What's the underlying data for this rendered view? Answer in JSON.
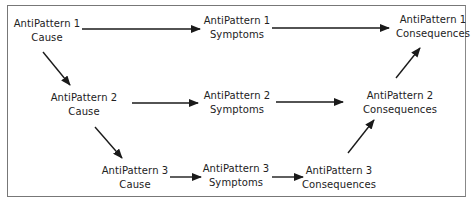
{
  "diagram": {
    "type": "flow",
    "nodes": [
      {
        "id": "c1",
        "line1": "AntiPattern 1",
        "line2": "Cause"
      },
      {
        "id": "s1",
        "line1": "AntiPattern 1",
        "line2": "Symptoms"
      },
      {
        "id": "q1",
        "line1": "AntiPattern 1",
        "line2": "Consequences"
      },
      {
        "id": "c2",
        "line1": "AntiPattern 2",
        "line2": "Cause"
      },
      {
        "id": "s2",
        "line1": "AntiPattern 2",
        "line2": "Symptoms"
      },
      {
        "id": "q2",
        "line1": "AntiPattern 2",
        "line2": "Consequences"
      },
      {
        "id": "c3",
        "line1": "AntiPattern 3",
        "line2": "Cause"
      },
      {
        "id": "s3",
        "line1": "AntiPattern 3",
        "line2": "Symptoms"
      },
      {
        "id": "q3",
        "line1": "AntiPattern 3",
        "line2": "Consequences"
      }
    ],
    "edges": [
      {
        "from": "c1",
        "to": "s1"
      },
      {
        "from": "s1",
        "to": "q1"
      },
      {
        "from": "c1",
        "to": "c2"
      },
      {
        "from": "c2",
        "to": "s2"
      },
      {
        "from": "s2",
        "to": "q2"
      },
      {
        "from": "q2",
        "to": "q1"
      },
      {
        "from": "c2",
        "to": "c3"
      },
      {
        "from": "c3",
        "to": "s3"
      },
      {
        "from": "s3",
        "to": "q3"
      },
      {
        "from": "q3",
        "to": "q2"
      }
    ],
    "colors": {
      "line": "#1a1a1a",
      "text": "#222222",
      "border": "#777777"
    }
  }
}
